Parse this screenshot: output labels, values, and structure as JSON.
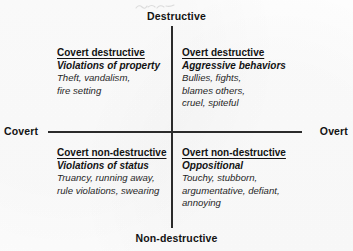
{
  "diagram": {
    "type": "2x2-quadrant",
    "axes": {
      "vertical": {
        "top_pole": "Destructive",
        "bottom_pole": "Non-destructive"
      },
      "horizontal": {
        "left_pole": "Covert",
        "right_pole": "Overt"
      }
    },
    "quadrants": [
      {
        "position": "top-left",
        "heading": "Covert destructive",
        "subheading": "Violations of property",
        "items": [
          "Theft, vandalism,",
          "fire setting"
        ]
      },
      {
        "position": "top-right",
        "heading": "Overt destructive",
        "subheading": "Aggressive behaviors",
        "items": [
          "Bullies, fights,",
          "blames others,",
          "cruel, spiteful"
        ]
      },
      {
        "position": "bottom-left",
        "heading": "Covert non-destructive",
        "subheading": "Violations of status",
        "items": [
          "Truancy, running away,",
          "rule violations, swearing"
        ]
      },
      {
        "position": "bottom-right",
        "heading": "Overt non-destructive",
        "subheading": "Oppositional",
        "items": [
          "Touchy, stubborn,",
          "argumentative, defiant,",
          "annoying"
        ]
      }
    ],
    "colors": {
      "axis": "#2b2b2b",
      "text": "#131313",
      "background": "#fdfdfd"
    }
  }
}
